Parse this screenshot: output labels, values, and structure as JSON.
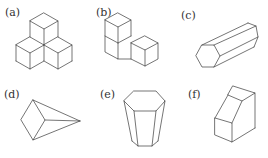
{
  "figures": [
    {
      "id": "a",
      "label": "(a)",
      "description": "three cubes arrangement (one on top of two)"
    },
    {
      "id": "b",
      "label": "(b)",
      "description": "L-shaped stack of three cubes"
    },
    {
      "id": "c",
      "label": "(c)",
      "description": "hexagonal prism lying on its side"
    },
    {
      "id": "d",
      "label": "(d)",
      "description": "quadrilateral pyramid lying on its side"
    },
    {
      "id": "e",
      "label": "(e)",
      "description": "hexagonal frustum"
    },
    {
      "id": "f",
      "label": "(f)",
      "description": "beveled block / truncated prism"
    }
  ],
  "colors": {
    "stroke": "#3a3a3a",
    "label": "#333333",
    "background": "#ffffff"
  }
}
